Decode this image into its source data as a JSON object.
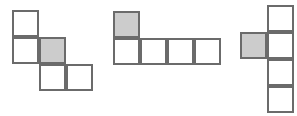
{
  "canvas": {
    "width": 297,
    "height": 116,
    "background": "#ffffff"
  },
  "style": {
    "cell_size": 27,
    "stroke_color": "#6b6b6b",
    "stroke_width": 2,
    "fill_plain": "#ffffff",
    "fill_shaded": "#cccccc"
  },
  "figures": [
    {
      "name": "figure-1-staircase",
      "label": "Figure 1",
      "origin_x": 12,
      "origin_y": 10,
      "grid_rows": 3,
      "grid_cols": 3,
      "square_count": 5,
      "shaded_count": 1,
      "cells": [
        {
          "row": 0,
          "col": 0,
          "shaded": false
        },
        {
          "row": 1,
          "col": 0,
          "shaded": false
        },
        {
          "row": 1,
          "col": 1,
          "shaded": true
        },
        {
          "row": 2,
          "col": 1,
          "shaded": false
        },
        {
          "row": 2,
          "col": 2,
          "shaded": false
        }
      ]
    },
    {
      "name": "figure-2-l-shape",
      "label": "Figure 2",
      "origin_x": 113,
      "origin_y": 11,
      "grid_rows": 2,
      "grid_cols": 4,
      "square_count": 5,
      "shaded_count": 1,
      "cells": [
        {
          "row": 0,
          "col": 0,
          "shaded": true
        },
        {
          "row": 1,
          "col": 0,
          "shaded": false
        },
        {
          "row": 1,
          "col": 1,
          "shaded": false
        },
        {
          "row": 1,
          "col": 2,
          "shaded": false
        },
        {
          "row": 1,
          "col": 3,
          "shaded": false
        }
      ]
    },
    {
      "name": "figure-3-column",
      "label": "Figure 3",
      "origin_x": 240,
      "origin_y": 5,
      "grid_rows": 4,
      "grid_cols": 2,
      "square_count": 5,
      "shaded_count": 1,
      "cells": [
        {
          "row": 0,
          "col": 1,
          "shaded": false
        },
        {
          "row": 1,
          "col": 0,
          "shaded": true
        },
        {
          "row": 1,
          "col": 1,
          "shaded": false
        },
        {
          "row": 2,
          "col": 1,
          "shaded": false
        },
        {
          "row": 3,
          "col": 1,
          "shaded": false
        }
      ]
    }
  ]
}
